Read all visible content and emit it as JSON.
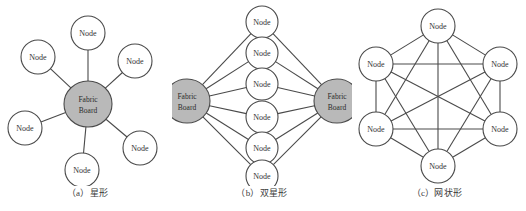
{
  "figure": {
    "background_color": "#ffffff",
    "edge_color": "#4a4a4a",
    "node_fill_color": "#ffffff",
    "hub_fill_color": "#b9b9b9",
    "text_color": "#333333"
  },
  "labels": {
    "node": "Node",
    "hub_line1": "Fabric",
    "hub_line2": "Board"
  },
  "panels": [
    {
      "id": "a",
      "caption": "（a）星形",
      "topology_type": "star",
      "node_count": 6,
      "hub_count": 1,
      "edge_count": 6,
      "nodes": [
        {
          "name": "node-a-1",
          "label": "Node",
          "cx": 88,
          "cy": 33,
          "r": 17
        },
        {
          "name": "node-a-2",
          "label": "Node",
          "cx": 38,
          "cy": 57,
          "r": 17
        },
        {
          "name": "node-a-3",
          "label": "Node",
          "cx": 135,
          "cy": 61,
          "r": 17
        },
        {
          "name": "node-a-4",
          "label": "Node",
          "cx": 25,
          "cy": 128,
          "r": 17
        },
        {
          "name": "node-a-5",
          "label": "Node",
          "cx": 140,
          "cy": 148,
          "r": 17
        },
        {
          "name": "node-a-6",
          "label": "Node",
          "cx": 82,
          "cy": 170,
          "r": 17
        }
      ],
      "hubs": [
        {
          "name": "hub-a-center",
          "line1": "Fabric",
          "line2": "Board",
          "cx": 88,
          "cy": 104,
          "rx": 24,
          "ry": 23
        }
      ]
    },
    {
      "id": "b",
      "caption": "（b）双星形",
      "topology_type": "dual-star",
      "node_count": 6,
      "hub_count": 2,
      "edge_count": 12,
      "nodes": [
        {
          "name": "node-b-1",
          "label": "Node",
          "cx": 90,
          "cy": 22,
          "r": 16
        },
        {
          "name": "node-b-2",
          "label": "Node",
          "cx": 90,
          "cy": 53,
          "r": 16
        },
        {
          "name": "node-b-3",
          "label": "Node",
          "cx": 90,
          "cy": 84,
          "r": 16
        },
        {
          "name": "node-b-4",
          "label": "Node",
          "cx": 90,
          "cy": 117,
          "r": 16
        },
        {
          "name": "node-b-5",
          "label": "Node",
          "cx": 90,
          "cy": 148,
          "r": 16
        },
        {
          "name": "node-b-6",
          "label": "Node",
          "cx": 90,
          "cy": 176,
          "r": 16
        }
      ],
      "hubs": [
        {
          "name": "hub-b-left",
          "line1": "Fabric",
          "line2": "Board",
          "cx": 15,
          "cy": 101,
          "rx": 23,
          "ry": 22
        },
        {
          "name": "hub-b-right",
          "line1": "Fabric",
          "line2": "Board",
          "cx": 165,
          "cy": 101,
          "rx": 23,
          "ry": 22
        }
      ]
    },
    {
      "id": "c",
      "caption": "（c）网状形",
      "topology_type": "full-mesh",
      "node_count": 6,
      "hub_count": 0,
      "edge_count": 15,
      "nodes": [
        {
          "name": "node-c-1",
          "label": "Node",
          "cx": 90,
          "cy": 26,
          "r": 17
        },
        {
          "name": "node-c-2",
          "label": "Node",
          "cx": 28,
          "cy": 64,
          "r": 17
        },
        {
          "name": "node-c-3",
          "label": "Node",
          "cx": 152,
          "cy": 64,
          "r": 17
        },
        {
          "name": "node-c-4",
          "label": "Node",
          "cx": 28,
          "cy": 129,
          "r": 17
        },
        {
          "name": "node-c-5",
          "label": "Node",
          "cx": 152,
          "cy": 129,
          "r": 17
        },
        {
          "name": "node-c-6",
          "label": "Node",
          "cx": 90,
          "cy": 166,
          "r": 17
        }
      ],
      "hubs": []
    }
  ]
}
